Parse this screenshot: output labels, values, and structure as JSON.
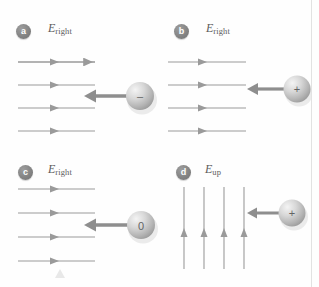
{
  "figure": {
    "background_color": "#fefefe",
    "border_color": "#e2e2e2",
    "field_line_color": "#9a9a9a",
    "force_arrow_color": "#8e8e8e",
    "sphere_light": "#f1f1f1",
    "sphere_mid": "#c8c8c8",
    "sphere_dark": "#9a9a9a",
    "badge_color": "#848484",
    "label_color": "#5b5b5b"
  },
  "panels": [
    {
      "id": "a",
      "badge_label": "a",
      "field_label_symbol": "E",
      "field_label_subscript": "right",
      "field_direction": "right",
      "field_line_count": 4,
      "charge_sign": "–",
      "charge_name": "negative-charge",
      "force_direction": "left"
    },
    {
      "id": "b",
      "badge_label": "b",
      "field_label_symbol": "E",
      "field_label_subscript": "right",
      "field_direction": "right",
      "field_line_count": 4,
      "charge_sign": "+",
      "charge_name": "positive-charge",
      "force_direction": "left"
    },
    {
      "id": "c",
      "badge_label": "c",
      "field_label_symbol": "E",
      "field_label_subscript": "right",
      "field_direction": "right",
      "field_line_count": 4,
      "charge_sign": "0",
      "charge_name": "neutral-charge",
      "force_direction": "left"
    },
    {
      "id": "d",
      "badge_label": "d",
      "field_label_symbol": "E",
      "field_label_subscript": "up",
      "field_direction": "up",
      "field_line_count": 4,
      "charge_sign": "+",
      "charge_name": "positive-charge",
      "force_direction": "left"
    }
  ]
}
